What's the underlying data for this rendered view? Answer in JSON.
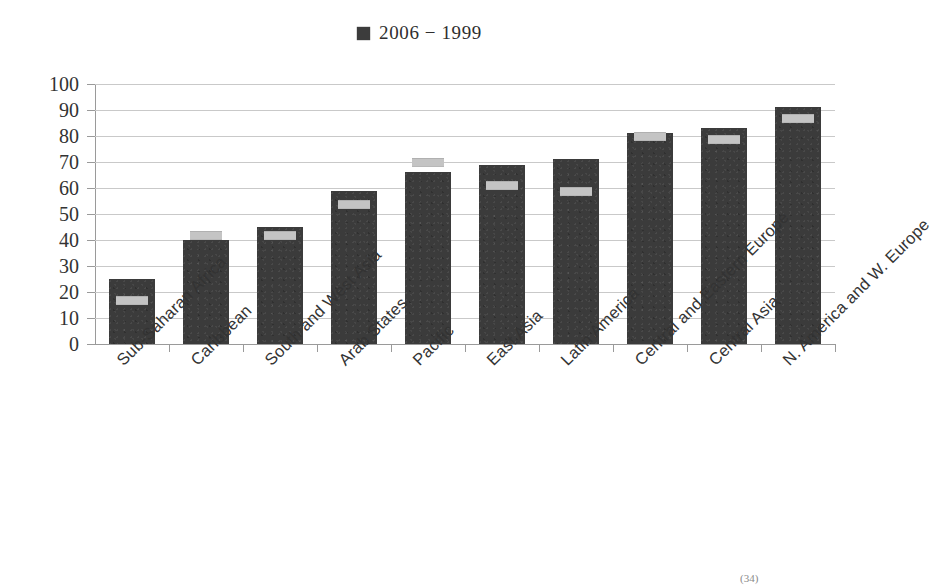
{
  "legend": {
    "marker_icon": "filled-square-marker",
    "text": "2006  − 1999",
    "series_current_label": "2006",
    "series_previous_label": "1999",
    "series_color": "#3b3b3b",
    "marker_color": "#c4c4c4"
  },
  "footnote": "(34)",
  "chart_data": {
    "type": "bar",
    "title": "",
    "subtitle": "",
    "xlabel": "",
    "ylabel": "",
    "ylim": [
      0,
      100
    ],
    "yticks": [
      0,
      10,
      20,
      30,
      40,
      50,
      60,
      70,
      80,
      90,
      100
    ],
    "grid": true,
    "legend_position": "top-center",
    "categories": [
      "Sub-Saharan Africa",
      "Caribbean",
      "South and West Asia",
      "Arab States",
      "Pacific",
      "East Asia",
      "Latin America",
      "Central and Eastern Europe",
      "Central Asia",
      "N. America and W. Europe"
    ],
    "series": [
      {
        "name": "2006",
        "render": "bar",
        "values": [
          25,
          40,
          45,
          59,
          66,
          69,
          71,
          81,
          83,
          91
        ]
      },
      {
        "name": "1999",
        "render": "marker",
        "values": [
          17,
          42,
          42,
          54,
          70,
          61,
          59,
          80,
          79,
          87
        ]
      }
    ]
  }
}
